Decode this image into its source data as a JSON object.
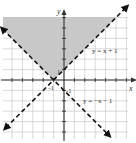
{
  "chart_data": {
    "type": "line",
    "title": "",
    "xlabel": "x",
    "ylabel": "y",
    "xlim": [
      -6,
      6
    ],
    "ylim": [
      -6,
      6
    ],
    "grid": true,
    "grid_step": 1,
    "tick_labels": [
      {
        "text": "1",
        "axis": "y",
        "value": 1
      },
      {
        "text": "-1",
        "axis": "x",
        "value": -1
      },
      {
        "text": "-1",
        "axis": "y",
        "value": -1
      }
    ],
    "series": [
      {
        "name": "y = x + 1",
        "style": "dashed",
        "slope": 1,
        "intercept": 1,
        "arrows": "both"
      },
      {
        "name": "y = -x - 1",
        "style": "dashed",
        "slope": -1,
        "intercept": -1,
        "arrows": "both"
      }
    ],
    "shaded_region": {
      "description": "y > x + 1 and y > -x - 1",
      "vertex": [
        -1,
        0
      ],
      "color": "#c8c8c8"
    },
    "annotations": [
      {
        "text": "y = x + 1",
        "x": 3.2,
        "y": 2.8
      },
      {
        "text": "y = −x − 1",
        "x": 2.0,
        "y": -2.0
      }
    ]
  },
  "colors": {
    "shade": "#c8c8c8",
    "grid": "#c9c9c9",
    "axis": "#333333",
    "line": "#111111"
  }
}
